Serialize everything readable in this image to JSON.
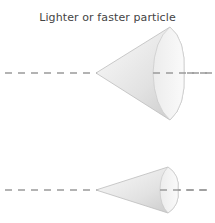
{
  "title": "Lighter or faster particle",
  "diagram": {
    "cones": [
      {
        "name": "wide-cone",
        "description": "Wide cone opening angle for lighter or faster particle",
        "apex": [
          96,
          73
        ],
        "base_x": 183,
        "base_half_height": 47
      },
      {
        "name": "narrow-cone",
        "description": "Narrow cone opening angle",
        "apex": [
          96,
          190
        ],
        "base_x": 176,
        "base_half_height": 23
      }
    ],
    "axes": [
      {
        "name": "axis-line-top",
        "y": 73,
        "style": "dashed"
      },
      {
        "name": "axis-line-bottom",
        "y": 190,
        "style": "dashed"
      }
    ],
    "colors": {
      "dash": "#9a9a9a",
      "cone_light": "#f4f4f4",
      "cone_dark": "#cfcfcf",
      "cone_edge": "#bdbdbd",
      "text": "#444444"
    }
  }
}
